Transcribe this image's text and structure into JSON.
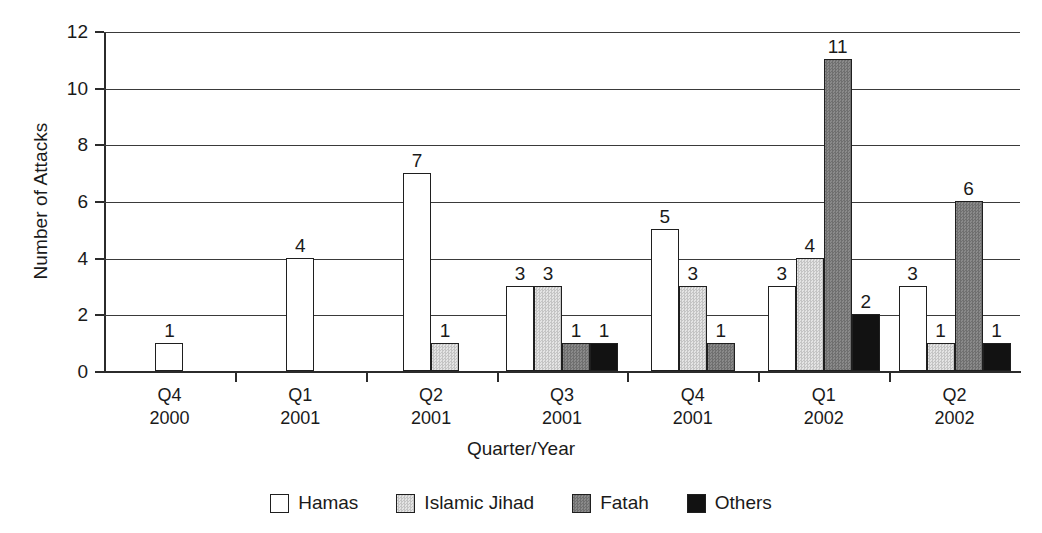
{
  "chart_data": {
    "type": "bar",
    "title": "",
    "xlabel": "Quarter/Year",
    "ylabel": "Number of Attacks",
    "ylim": [
      0,
      12
    ],
    "ytick_labels": [
      "0",
      "2",
      "4",
      "6",
      "8",
      "10",
      "12"
    ],
    "ytick_values": [
      0,
      2,
      4,
      6,
      8,
      10,
      12
    ],
    "grid": true,
    "legend_position": "bottom",
    "categories": [
      "Q4\n2000",
      "Q1\n2001",
      "Q2\n2001",
      "Q3\n2001",
      "Q4\n2001",
      "Q1\n2002",
      "Q2\n2002"
    ],
    "category_labels": [
      {
        "quarter": "Q4",
        "year": "2000"
      },
      {
        "quarter": "Q1",
        "year": "2001"
      },
      {
        "quarter": "Q2",
        "year": "2001"
      },
      {
        "quarter": "Q3",
        "year": "2001"
      },
      {
        "quarter": "Q4",
        "year": "2001"
      },
      {
        "quarter": "Q1",
        "year": "2002"
      },
      {
        "quarter": "Q2",
        "year": "2002"
      }
    ],
    "series": [
      {
        "name": "Hamas",
        "color": "#ffffff",
        "values": [
          1,
          4,
          7,
          3,
          5,
          3,
          3
        ]
      },
      {
        "name": "Islamic Jihad",
        "color": "#d4d4d4",
        "values": [
          0,
          0,
          1,
          3,
          3,
          4,
          1
        ]
      },
      {
        "name": "Fatah",
        "color": "#7d7d7d",
        "values": [
          0,
          0,
          0,
          1,
          1,
          11,
          6
        ]
      },
      {
        "name": "Others",
        "color": "#121212",
        "values": [
          0,
          0,
          0,
          1,
          0,
          2,
          1
        ]
      }
    ],
    "data_labels": [
      {
        "category": "Q4 2000",
        "series": "Hamas",
        "value": 1
      },
      {
        "category": "Q1 2001",
        "series": "Hamas",
        "value": 4
      },
      {
        "category": "Q2 2001",
        "series": "Hamas",
        "value": 7
      },
      {
        "category": "Q2 2001",
        "series": "Islamic Jihad",
        "value": 1
      },
      {
        "category": "Q3 2001",
        "series": "Hamas",
        "value": 3
      },
      {
        "category": "Q3 2001",
        "series": "Islamic Jihad",
        "value": 3
      },
      {
        "category": "Q3 2001",
        "series": "Fatah",
        "value": 1
      },
      {
        "category": "Q3 2001",
        "series": "Others",
        "value": 1
      },
      {
        "category": "Q4 2001",
        "series": "Hamas",
        "value": 5
      },
      {
        "category": "Q4 2001",
        "series": "Islamic Jihad",
        "value": 3
      },
      {
        "category": "Q4 2001",
        "series": "Fatah",
        "value": 1
      },
      {
        "category": "Q1 2002",
        "series": "Hamas",
        "value": 3
      },
      {
        "category": "Q1 2002",
        "series": "Islamic Jihad",
        "value": 4
      },
      {
        "category": "Q1 2002",
        "series": "Fatah",
        "value": 11
      },
      {
        "category": "Q1 2002",
        "series": "Others",
        "value": 2
      },
      {
        "category": "Q2 2002",
        "series": "Hamas",
        "value": 3
      },
      {
        "category": "Q2 2002",
        "series": "Islamic Jihad",
        "value": 1
      },
      {
        "category": "Q2 2002",
        "series": "Fatah",
        "value": 6
      },
      {
        "category": "Q2 2002",
        "series": "Others",
        "value": 1
      }
    ]
  },
  "legend": {
    "items": [
      {
        "label": "Hamas",
        "key": "hamas"
      },
      {
        "label": "Islamic Jihad",
        "key": "ij"
      },
      {
        "label": "Fatah",
        "key": "fatah"
      },
      {
        "label": "Others",
        "key": "others"
      }
    ]
  }
}
